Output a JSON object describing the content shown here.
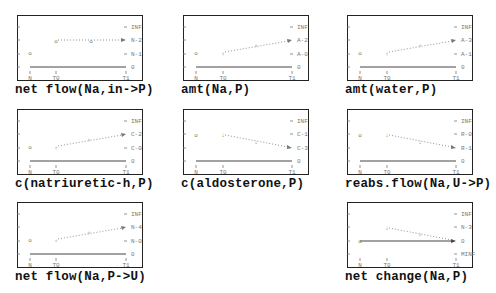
{
  "figure": {
    "panels": [
      {
        "id": "net-flow-na-in-p",
        "title": "net flow(Na,in->P)",
        "y_labels": [
          "INF",
          "N-2",
          "N-1",
          "0"
        ],
        "x_labels": [
          "N",
          "T0",
          "T1"
        ],
        "shape": "flat-high",
        "initial_marker": "o",
        "trajectory_marker": "o"
      },
      {
        "id": "amt-na-p",
        "title": "amt(Na,P)",
        "y_labels": [
          "INF",
          "A-2",
          "A-0",
          "0"
        ],
        "x_labels": [
          "N",
          "T0",
          "T1"
        ],
        "shape": "increasing",
        "initial_marker": "o",
        "trajectory_marker": "↑"
      },
      {
        "id": "amt-water-p",
        "title": "amt(water,P)",
        "y_labels": [
          "INF",
          "A-3",
          "A-1",
          "0"
        ],
        "x_labels": [
          "N",
          "T0",
          "T1"
        ],
        "shape": "increasing",
        "initial_marker": "o",
        "trajectory_marker": "↑"
      },
      {
        "id": "c-natriuretic-h-p",
        "title": "c(natriuretic-h,P)",
        "y_labels": [
          "INF",
          "C-2",
          "C-0",
          "0"
        ],
        "x_labels": [
          "N",
          "T0",
          "T1"
        ],
        "shape": "increasing",
        "initial_marker": "o",
        "trajectory_marker": "↑"
      },
      {
        "id": "c-aldosterone-p",
        "title": "c(aldosterone,P)",
        "y_labels": [
          "INF",
          "C-1",
          "C-3",
          "0"
        ],
        "x_labels": [
          "N",
          "T0",
          "T1"
        ],
        "shape": "decreasing",
        "initial_marker": "o",
        "trajectory_marker": "↓"
      },
      {
        "id": "reabs-flow-na-u-p",
        "title": "reabs.flow(Na,U->P)",
        "y_labels": [
          "INF",
          "R-0",
          "R-1",
          "0"
        ],
        "x_labels": [
          "N",
          "T0",
          "T1"
        ],
        "shape": "decreasing",
        "initial_marker": "o",
        "trajectory_marker": "↓"
      },
      {
        "id": "net-flow-na-p-u",
        "title": "net flow(Na,P->U)",
        "y_labels": [
          "INF",
          "N-4",
          "N-0",
          "0"
        ],
        "x_labels": [
          "N",
          "T0",
          "T1"
        ],
        "shape": "increasing",
        "initial_marker": "o",
        "trajectory_marker": "↑"
      },
      {
        "id": "net-change-na-p",
        "title": "net change(Na,P)",
        "y_labels": [
          "INF",
          "N-3",
          "0",
          "MINF"
        ],
        "x_labels": [
          "N",
          "T0",
          "T1"
        ],
        "shape": "decreasing-to-zero",
        "initial_marker": "o",
        "trajectory_marker": "↓"
      }
    ]
  }
}
